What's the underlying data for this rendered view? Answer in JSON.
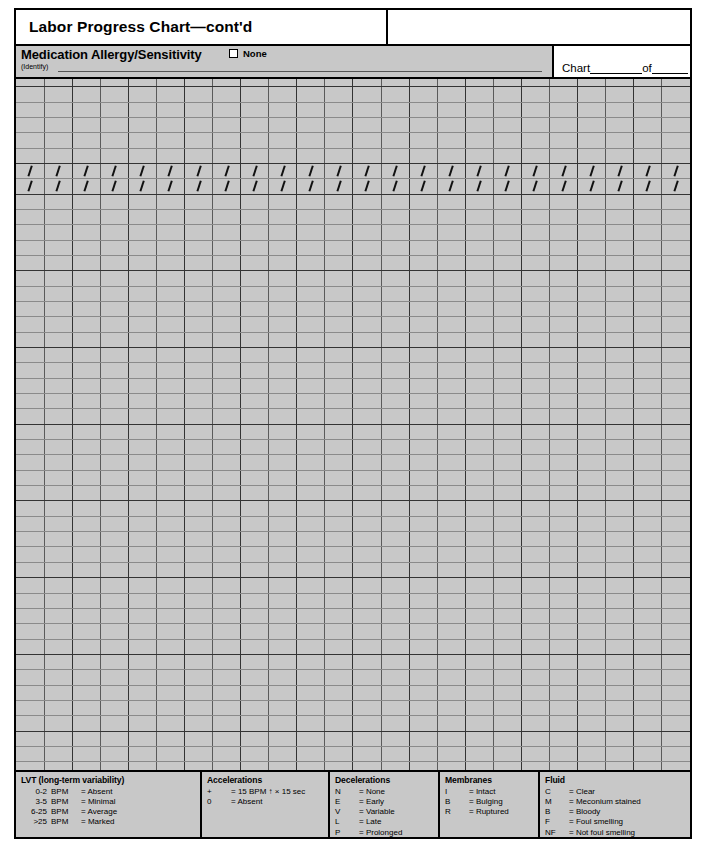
{
  "header": {
    "title": "Labor Progress Chart—cont'd",
    "allergy_label": "Medication Allergy/Sensitivity",
    "none_label": "None",
    "identify_label": "(Identify)",
    "chart_label": "Chart",
    "chart_of": "of"
  },
  "grid": {
    "columns": 24,
    "rows": 46,
    "slash_rows": [
      6,
      7
    ],
    "group_end_rows": [
      0,
      5,
      7,
      12,
      17,
      22,
      27,
      32,
      37,
      42
    ],
    "shade_color": "#c8c8c8",
    "white_color": "#ffffff",
    "shaded_column_pairs": [
      0,
      2,
      4,
      6,
      8,
      10,
      12,
      14,
      16,
      18,
      20,
      22
    ]
  },
  "legend": [
    {
      "title": "LVT (long-term variability)",
      "rows": [
        {
          "key": "0-2",
          "mid": "BPM",
          "val": "= Absent"
        },
        {
          "key": "3-5",
          "mid": "BPM",
          "val": "= Minimal"
        },
        {
          "key": "6-25",
          "mid": "BPM",
          "val": "= Average"
        },
        {
          "key": ">25",
          "mid": "BPM",
          "val": "= Marked"
        }
      ]
    },
    {
      "title": "Accelerations",
      "rows": [
        {
          "key": "+",
          "mid": "",
          "val": "= 15 BPM ↑ × 15 sec"
        },
        {
          "key": "0",
          "mid": "",
          "val": "= Absent"
        }
      ]
    },
    {
      "title": "Decelerations",
      "rows": [
        {
          "key": "N",
          "mid": "",
          "val": "= None"
        },
        {
          "key": "E",
          "mid": "",
          "val": "= Early"
        },
        {
          "key": "V",
          "mid": "",
          "val": "= Variable"
        },
        {
          "key": "L",
          "mid": "",
          "val": "= Late"
        },
        {
          "key": "P",
          "mid": "",
          "val": "= Prolonged"
        }
      ]
    },
    {
      "title": "Membranes",
      "rows": [
        {
          "key": "I",
          "mid": "",
          "val": "= Intact"
        },
        {
          "key": "B",
          "mid": "",
          "val": "= Bulging"
        },
        {
          "key": "R",
          "mid": "",
          "val": "= Ruptured"
        }
      ]
    },
    {
      "title": "Fluid",
      "rows": [
        {
          "key": "C",
          "mid": "",
          "val": "= Clear"
        },
        {
          "key": "M",
          "mid": "",
          "val": "= Meconium stained"
        },
        {
          "key": "B",
          "mid": "",
          "val": "= Bloody"
        },
        {
          "key": "F",
          "mid": "",
          "val": "= Foul smelling"
        },
        {
          "key": "NF",
          "mid": "",
          "val": "= Not foul smelling"
        }
      ]
    }
  ]
}
